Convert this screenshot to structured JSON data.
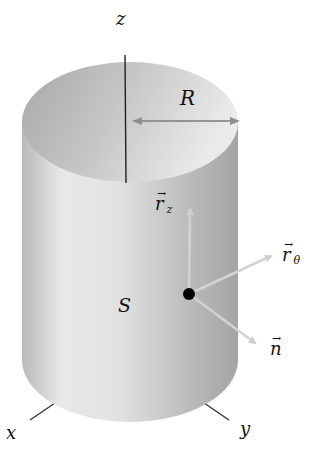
{
  "diagram": {
    "type": "cylinder-surface-vectors",
    "colors": {
      "surface_light": "#eeeeee",
      "surface_dark": "#9e9e9e",
      "vector": "#d0d0d0",
      "axis": "#222222",
      "point": "#000000"
    },
    "labels": {
      "z_axis": "z",
      "x_axis": "x",
      "y_axis": "y",
      "radius": "R",
      "surface": "S",
      "rz_base": "r",
      "rz_sub": "z",
      "rtheta_base": "r",
      "rtheta_sub": "θ",
      "normal": "n",
      "vec_arrow": "→"
    }
  }
}
